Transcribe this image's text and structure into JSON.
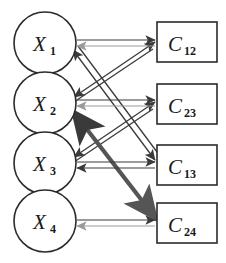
{
  "diagram": {
    "canvas": {
      "width": 226,
      "height": 263,
      "background": "#ffffff"
    },
    "colors": {
      "outline": "#2b2b2b",
      "fill": "#ffffff",
      "arrow_dark": "#3a3a3a",
      "arrow_gray": "#9a9a9a",
      "text": "#1a1a1a"
    },
    "variable_nodes": [
      {
        "id": "X1",
        "base": "X",
        "sub": "1",
        "label": "X₁",
        "shape": "circle",
        "cx": 45,
        "cy": 43,
        "r": 31
      },
      {
        "id": "X2",
        "base": "X",
        "sub": "2",
        "label": "X₂",
        "shape": "circle",
        "cx": 45,
        "cy": 103,
        "r": 31
      },
      {
        "id": "X3",
        "base": "X",
        "sub": "3",
        "label": "X₃",
        "shape": "circle",
        "cx": 45,
        "cy": 163,
        "r": 31
      },
      {
        "id": "X4",
        "base": "X",
        "sub": "4",
        "label": "X₄",
        "shape": "circle",
        "cx": 45,
        "cy": 221,
        "r": 31
      }
    ],
    "constraint_nodes": [
      {
        "id": "C12",
        "base": "C",
        "sub": "12",
        "label": "C₁₂",
        "shape": "rect",
        "x": 157,
        "y": 22,
        "w": 60,
        "h": 40
      },
      {
        "id": "C23",
        "base": "C",
        "sub": "23",
        "label": "C₂₃",
        "shape": "rect",
        "x": 157,
        "y": 84,
        "w": 60,
        "h": 40
      },
      {
        "id": "C13",
        "base": "C",
        "sub": "13",
        "label": "C₁₃",
        "shape": "rect",
        "x": 157,
        "y": 145,
        "w": 60,
        "h": 40
      },
      {
        "id": "C24",
        "base": "C",
        "sub": "24",
        "label": "C₂₄",
        "shape": "rect",
        "x": 157,
        "y": 203,
        "w": 60,
        "h": 40
      }
    ],
    "edges": [
      {
        "id": "e-x1-c12",
        "from": "X1",
        "to": "C12",
        "kind": "horizontal",
        "forward_color": "#3a3a3a",
        "backward_color": "#9a9a9a",
        "double_headed": true
      },
      {
        "id": "e-x2-c23",
        "from": "X2",
        "to": "C23",
        "kind": "horizontal",
        "forward_color": "#3a3a3a",
        "backward_color": "#9a9a9a",
        "double_headed": true
      },
      {
        "id": "e-x3-c13",
        "from": "X3",
        "to": "C13",
        "kind": "horizontal",
        "forward_color": "#3a3a3a",
        "backward_color": "#3a3a3a",
        "double_headed": true
      },
      {
        "id": "e-x4-c24",
        "from": "X4",
        "to": "C24",
        "kind": "horizontal",
        "forward_color": "#3a3a3a",
        "backward_color": "#9a9a9a",
        "double_headed": true
      },
      {
        "id": "e-x2-c12",
        "from": "X2",
        "to": "C12",
        "kind": "diagonal",
        "forward_color": "#555555",
        "backward_color": "#3a3a3a",
        "double_headed": true
      },
      {
        "id": "e-x3-c23",
        "from": "X3",
        "to": "C23",
        "kind": "diagonal",
        "forward_color": "#3a3a3a",
        "backward_color": "#3a3a3a",
        "double_headed": true
      },
      {
        "id": "e-x1-c13",
        "from": "X1",
        "to": "C13",
        "kind": "diagonal",
        "forward_color": "#3a3a3a",
        "backward_color": "#3a3a3a",
        "double_headed": true
      },
      {
        "id": "e-x2-c24",
        "from": "X2",
        "to": "C24",
        "kind": "diagonal",
        "forward_color": "#555555",
        "backward_color": "#3a3a3a",
        "double_headed": true
      }
    ]
  }
}
